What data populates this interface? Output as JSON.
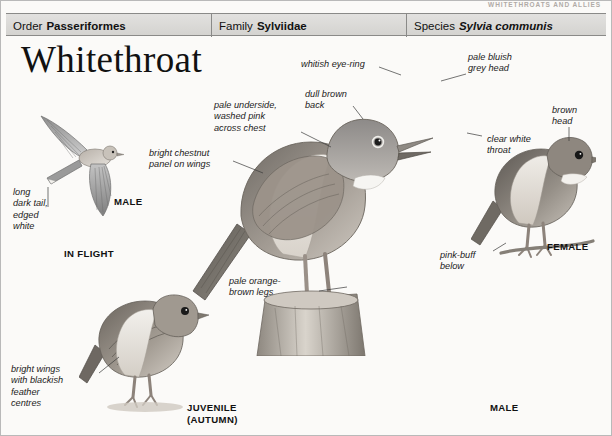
{
  "page": {
    "running_header": "WHITETHROATS AND ALLIES",
    "title": "Whitethroat"
  },
  "taxonomy": {
    "order": {
      "label": "Order",
      "value": "Passeriformes"
    },
    "family": {
      "label": "Family",
      "value": "Sylviidae"
    },
    "species": {
      "label": "Species",
      "value": "Sylvia communis"
    }
  },
  "annotations": {
    "whitish_eye_ring": "whitish eye-ring",
    "pale_bluish_grey_head": "pale bluish\ngrey head",
    "dull_brown_back": "dull brown\nback",
    "pale_underside": "pale underside,\nwashed pink\nacross chest",
    "bright_chestnut_panel": "bright chestnut\npanel on wings",
    "clear_white_throat": "clear white\nthroat",
    "brown_head": "brown\nhead",
    "pink_buff_below": "pink-buff\nbelow",
    "long_dark_tail": "long\ndark tail,\nedged\nwhite",
    "pale_orange_brown_legs": "pale orange-\nbrown legs",
    "bright_wings": "bright wings\nwith blackish\nfeather\ncentres"
  },
  "captions": {
    "in_flight_male": "MALE",
    "in_flight": "IN FLIGHT",
    "female": "FEMALE",
    "juvenile": "JUVENILE\n(AUTUMN)",
    "male": "MALE"
  },
  "colors": {
    "bar_top": "#e2e1df",
    "bar_bottom": "#d4d3d0",
    "rule": "#8a8a88",
    "page_bg": "#fbfaf8",
    "text": "#111111"
  }
}
